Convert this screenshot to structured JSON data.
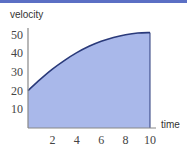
{
  "colors": {
    "top_band": "#5b6fc4",
    "fill": "#a9b8ea",
    "curve": "#2a3a7a",
    "axis": "#888888"
  },
  "chart_data": {
    "type": "area",
    "title": "",
    "xlabel": "time",
    "ylabel": "velocity",
    "x_ticks": [
      "2",
      "4",
      "6",
      "8",
      "10"
    ],
    "y_ticks": [
      "10",
      "20",
      "30",
      "40",
      "50"
    ],
    "xlim": [
      0,
      10
    ],
    "ylim": [
      0,
      50
    ],
    "grid": false,
    "legend": null,
    "series": [
      {
        "name": "velocity",
        "x": [
          0,
          1,
          2,
          3,
          4,
          5,
          6,
          7,
          8,
          9,
          10
        ],
        "values": [
          20,
          26,
          31.5,
          36.2,
          40.3,
          43.7,
          46.4,
          48.4,
          49.9,
          50.8,
          51
        ]
      }
    ]
  }
}
